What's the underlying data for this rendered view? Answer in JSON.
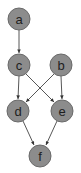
{
  "diagram": {
    "type": "directed-graph",
    "colors": {
      "node_fill": "#8c8c8c",
      "node_stroke": "#6a6a6a",
      "label": "#1e1e1e",
      "edge": "#444444"
    },
    "nodes": [
      {
        "id": "a",
        "label": "a",
        "x": 19,
        "y": 19
      },
      {
        "id": "c",
        "label": "c",
        "x": 19,
        "y": 65
      },
      {
        "id": "b",
        "label": "b",
        "x": 61,
        "y": 65
      },
      {
        "id": "d",
        "label": "d",
        "x": 18,
        "y": 111
      },
      {
        "id": "e",
        "label": "e",
        "x": 62,
        "y": 111
      },
      {
        "id": "f",
        "label": "f",
        "x": 40,
        "y": 156
      }
    ],
    "edges": [
      {
        "from": "a",
        "to": "c"
      },
      {
        "from": "c",
        "to": "d"
      },
      {
        "from": "c",
        "to": "e"
      },
      {
        "from": "b",
        "to": "d"
      },
      {
        "from": "b",
        "to": "e"
      },
      {
        "from": "d",
        "to": "f"
      },
      {
        "from": "e",
        "to": "f"
      }
    ]
  }
}
